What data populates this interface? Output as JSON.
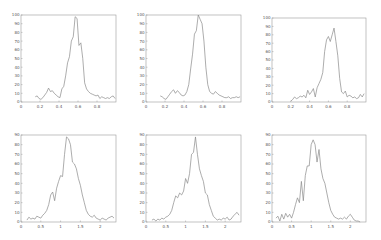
{
  "layout": {
    "rows": 2,
    "cols": 3
  },
  "style": {
    "line_color": "#8a8a8a",
    "axis_color": "#9a9a9a",
    "background": "#ffffff"
  },
  "chart_data": [
    {
      "type": "line",
      "title": "",
      "xlabel": "",
      "ylabel": "",
      "xlim": [
        0,
        1
      ],
      "ylim": [
        0,
        100
      ],
      "xticks": [
        0,
        0.2,
        0.4,
        0.6,
        0.8
      ],
      "xtick_labels": [
        "0",
        "0.2",
        "0.4",
        "0.6",
        "0.8"
      ],
      "yticks": [
        0,
        10,
        20,
        30,
        40,
        50,
        60,
        70,
        80,
        90,
        100
      ],
      "ytick_labels": [
        "0",
        "10",
        "20",
        "30",
        "40",
        "50",
        "60",
        "70",
        "80",
        "90",
        "100"
      ],
      "grid": false,
      "x": [
        0.15,
        0.17,
        0.19,
        0.21,
        0.23,
        0.25,
        0.27,
        0.29,
        0.31,
        0.33,
        0.35,
        0.37,
        0.39,
        0.41,
        0.43,
        0.45,
        0.47,
        0.49,
        0.51,
        0.53,
        0.55,
        0.57,
        0.59,
        0.61,
        0.63,
        0.65,
        0.67,
        0.69,
        0.71,
        0.73,
        0.75,
        0.77,
        0.79,
        0.81,
        0.83,
        0.85,
        0.87,
        0.89,
        0.91,
        0.93,
        0.95,
        0.97,
        0.99
      ],
      "values": [
        6,
        7,
        4,
        3,
        5,
        8,
        11,
        16,
        12,
        13,
        10,
        8,
        6,
        5,
        15,
        18,
        30,
        45,
        52,
        70,
        75,
        98,
        96,
        65,
        68,
        50,
        22,
        15,
        12,
        10,
        9,
        8,
        7,
        8,
        4,
        6,
        5,
        4,
        5,
        4,
        6,
        7,
        4
      ]
    },
    {
      "type": "line",
      "title": "",
      "xlabel": "",
      "ylabel": "",
      "xlim": [
        0,
        1
      ],
      "ylim": [
        0,
        100
      ],
      "xticks": [
        0,
        0.2,
        0.4,
        0.6,
        0.8
      ],
      "xtick_labels": [
        "0",
        "0.2",
        "0.4",
        "0.6",
        "0.8"
      ],
      "yticks": [
        0,
        10,
        20,
        30,
        40,
        50,
        60,
        70,
        80,
        90,
        100
      ],
      "ytick_labels": [
        "0",
        "10",
        "20",
        "30",
        "40",
        "50",
        "60",
        "70",
        "80",
        "90",
        "100"
      ],
      "grid": false,
      "x": [
        0.15,
        0.17,
        0.19,
        0.21,
        0.23,
        0.25,
        0.27,
        0.29,
        0.31,
        0.33,
        0.35,
        0.37,
        0.39,
        0.41,
        0.43,
        0.45,
        0.47,
        0.49,
        0.51,
        0.53,
        0.55,
        0.57,
        0.59,
        0.61,
        0.63,
        0.65,
        0.67,
        0.69,
        0.71,
        0.73,
        0.75,
        0.77,
        0.79,
        0.81,
        0.83,
        0.85,
        0.87,
        0.89,
        0.91,
        0.93,
        0.95,
        0.97,
        0.99
      ],
      "values": [
        7,
        6,
        4,
        3,
        6,
        9,
        12,
        14,
        10,
        13,
        11,
        8,
        7,
        8,
        12,
        20,
        38,
        55,
        78,
        82,
        100,
        95,
        90,
        70,
        40,
        20,
        12,
        10,
        9,
        12,
        10,
        8,
        7,
        6,
        5,
        5,
        6,
        4,
        5,
        5,
        6,
        5,
        6
      ]
    },
    {
      "type": "line",
      "title": "",
      "xlabel": "",
      "ylabel": "",
      "xlim": [
        0,
        1
      ],
      "ylim": [
        0,
        100
      ],
      "xticks": [
        0,
        0.2,
        0.4,
        0.6,
        0.8
      ],
      "xtick_labels": [
        "0",
        "0.2",
        "0.4",
        "0.6",
        "0.8"
      ],
      "yticks": [
        0,
        10,
        20,
        30,
        40,
        50,
        60,
        70,
        80,
        90,
        100
      ],
      "ytick_labels": [
        "0",
        "10",
        "20",
        "30",
        "40",
        "50",
        "60",
        "70",
        "80",
        "90",
        "100"
      ],
      "grid": false,
      "x": [
        0.2,
        0.22,
        0.24,
        0.26,
        0.28,
        0.3,
        0.32,
        0.34,
        0.36,
        0.38,
        0.4,
        0.42,
        0.44,
        0.46,
        0.48,
        0.5,
        0.52,
        0.54,
        0.56,
        0.58,
        0.6,
        0.62,
        0.64,
        0.66,
        0.68,
        0.7,
        0.72,
        0.74,
        0.76,
        0.78,
        0.8,
        0.82,
        0.84,
        0.86,
        0.88,
        0.9,
        0.92,
        0.94,
        0.96,
        0.98
      ],
      "values": [
        1,
        3,
        6,
        4,
        5,
        7,
        6,
        8,
        5,
        14,
        9,
        12,
        16,
        6,
        17,
        22,
        27,
        35,
        60,
        74,
        78,
        72,
        80,
        88,
        72,
        55,
        28,
        12,
        10,
        13,
        6,
        8,
        7,
        5,
        6,
        4,
        5,
        9,
        6,
        10
      ]
    },
    {
      "type": "line",
      "title": "",
      "xlabel": "",
      "ylabel": "",
      "xlim": [
        0,
        2.4
      ],
      "ylim": [
        0,
        90
      ],
      "xticks": [
        0,
        0.5,
        1,
        1.5,
        2
      ],
      "xtick_labels": [
        "0",
        "0.5",
        "1",
        "1.5",
        "2"
      ],
      "yticks": [
        0,
        10,
        20,
        30,
        40,
        50,
        60,
        70,
        80,
        90
      ],
      "ytick_labels": [
        "0",
        "10",
        "20",
        "30",
        "40",
        "50",
        "60",
        "70",
        "80",
        "90"
      ],
      "grid": false,
      "x": [
        0.15,
        0.2,
        0.25,
        0.3,
        0.35,
        0.4,
        0.45,
        0.5,
        0.55,
        0.6,
        0.65,
        0.7,
        0.75,
        0.8,
        0.85,
        0.9,
        0.95,
        1.0,
        1.05,
        1.1,
        1.15,
        1.2,
        1.25,
        1.3,
        1.35,
        1.4,
        1.45,
        1.5,
        1.55,
        1.6,
        1.65,
        1.7,
        1.75,
        1.8,
        1.85,
        1.9,
        1.95,
        2.0,
        2.05,
        2.1,
        2.15,
        2.2,
        2.25,
        2.3,
        2.35
      ],
      "values": [
        2,
        5,
        3,
        4,
        3,
        6,
        5,
        4,
        7,
        9,
        12,
        18,
        28,
        31,
        22,
        35,
        42,
        48,
        47,
        70,
        88,
        86,
        80,
        62,
        60,
        55,
        45,
        38,
        28,
        20,
        12,
        8,
        6,
        5,
        7,
        4,
        3,
        2,
        4,
        3,
        2,
        4,
        5,
        6,
        4
      ]
    },
    {
      "type": "line",
      "title": "",
      "xlabel": "",
      "ylabel": "",
      "xlim": [
        0,
        2.4
      ],
      "ylim": [
        0,
        90
      ],
      "xticks": [
        0,
        0.5,
        1,
        1.5,
        2
      ],
      "xtick_labels": [
        "0",
        "0.5",
        "1",
        "1.5",
        "2"
      ],
      "yticks": [
        0,
        10,
        20,
        30,
        40,
        50,
        60,
        70,
        80,
        90
      ],
      "ytick_labels": [
        "0",
        "10",
        "20",
        "30",
        "40",
        "50",
        "60",
        "70",
        "80",
        "90"
      ],
      "grid": false,
      "x": [
        0.15,
        0.2,
        0.25,
        0.3,
        0.35,
        0.4,
        0.45,
        0.5,
        0.55,
        0.6,
        0.65,
        0.7,
        0.75,
        0.8,
        0.85,
        0.9,
        0.95,
        1.0,
        1.05,
        1.1,
        1.15,
        1.2,
        1.25,
        1.3,
        1.35,
        1.4,
        1.45,
        1.5,
        1.55,
        1.6,
        1.65,
        1.7,
        1.75,
        1.8,
        1.85,
        1.9,
        1.95,
        2.0,
        2.05,
        2.1,
        2.15,
        2.2,
        2.25,
        2.3,
        2.35
      ],
      "values": [
        2,
        3,
        1,
        3,
        2,
        4,
        3,
        5,
        6,
        8,
        12,
        20,
        27,
        25,
        30,
        28,
        32,
        45,
        40,
        50,
        70,
        72,
        88,
        70,
        55,
        48,
        42,
        30,
        28,
        18,
        12,
        6,
        4,
        2,
        3,
        2,
        4,
        3,
        5,
        2,
        3,
        6,
        8,
        10,
        7
      ]
    },
    {
      "type": "line",
      "title": "",
      "xlabel": "",
      "ylabel": "",
      "xlim": [
        0,
        2.4
      ],
      "ylim": [
        0,
        90
      ],
      "xticks": [
        0,
        0.5,
        1,
        1.5,
        2
      ],
      "xtick_labels": [
        "0",
        "0.5",
        "1",
        "1.5",
        "2"
      ],
      "yticks": [
        0,
        10,
        20,
        30,
        40,
        50,
        60,
        70,
        80,
        90
      ],
      "ytick_labels": [
        "0",
        "10",
        "20",
        "30",
        "40",
        "50",
        "60",
        "70",
        "80",
        "90"
      ],
      "grid": false,
      "x": [
        0.1,
        0.15,
        0.2,
        0.25,
        0.3,
        0.35,
        0.4,
        0.45,
        0.5,
        0.55,
        0.6,
        0.65,
        0.7,
        0.75,
        0.8,
        0.85,
        0.9,
        0.95,
        1.0,
        1.05,
        1.1,
        1.15,
        1.2,
        1.25,
        1.3,
        1.35,
        1.4,
        1.45,
        1.5,
        1.55,
        1.6,
        1.65,
        1.7,
        1.75,
        1.8,
        1.85,
        1.9,
        1.95,
        2.0,
        2.05,
        2.1,
        2.15,
        2.2,
        2.25
      ],
      "values": [
        4,
        6,
        1,
        8,
        3,
        9,
        5,
        8,
        4,
        10,
        18,
        25,
        20,
        42,
        22,
        48,
        58,
        58,
        80,
        85,
        80,
        62,
        75,
        55,
        45,
        40,
        30,
        20,
        12,
        8,
        5,
        4,
        3,
        4,
        3,
        5,
        3,
        6,
        8,
        5,
        2,
        1,
        1,
        0
      ]
    }
  ]
}
